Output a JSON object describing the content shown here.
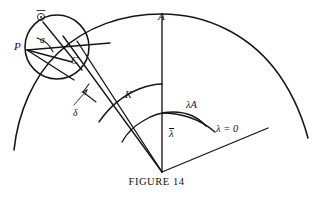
{
  "figure": {
    "caption": "FIGURE 14",
    "title": "FIGURE 14",
    "type": "geometric-diagram",
    "line_color": "#151515",
    "background_color": "#ffffff"
  },
  "labels": {
    "point_A": "A",
    "point_P": "P",
    "point_C": "C",
    "angle_a": "a",
    "arc_K": "K",
    "angle_delta": "δ",
    "arc_lambda_A": "λA",
    "angle_lambda_bar": "λ",
    "ray_lambda_zero": "λ = 0",
    "circle_center_symbol": "⊙"
  },
  "geometry": {
    "vertex": {
      "x": 162,
      "y": 172
    },
    "rays": [
      {
        "name": "vertical-to-A",
        "angle_deg": 90,
        "label": "A"
      },
      {
        "name": "baseline-lambda-zero",
        "angle_deg": -22,
        "label": "λ = 0"
      },
      {
        "name": "wedge-upper-edge",
        "angle_deg": 125
      },
      {
        "name": "wedge-lower-edge",
        "angle_deg": 122
      }
    ],
    "arcs": [
      {
        "name": "outer-great-arc",
        "label": ""
      },
      {
        "name": "arc-K",
        "label": "K",
        "radius": 80
      },
      {
        "name": "arc-lambda-A",
        "label": "λA",
        "radius": 58
      },
      {
        "name": "arc-lambda-bar",
        "label": "λ",
        "radius": 38
      }
    ],
    "circle": {
      "name": "small-circle",
      "center": {
        "x": 57,
        "y": 47
      },
      "radius": 32,
      "marked_points": [
        "P",
        "C",
        "⊙"
      ]
    }
  }
}
